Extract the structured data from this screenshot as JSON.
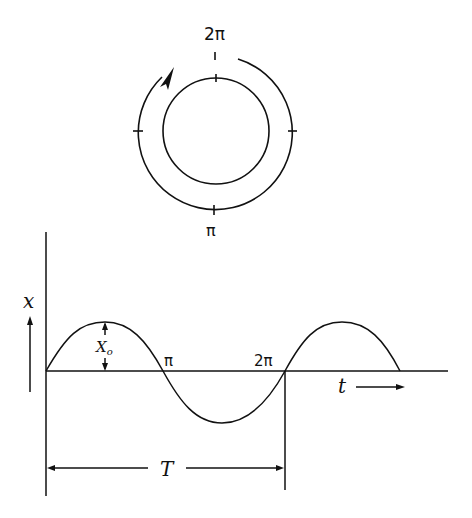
{
  "circle_diagram": {
    "top_label": "2π",
    "bottom_label": "π",
    "rotation_direction": "clockwise"
  },
  "wave_graph": {
    "y_axis_label": "x",
    "x_axis_label": "t",
    "amplitude_label": "X",
    "amplitude_subscript": "o",
    "crossing_labels": [
      "π",
      "2π"
    ],
    "period_label": "T"
  },
  "colors": {
    "stroke": "#111111",
    "background": "#ffffff"
  }
}
